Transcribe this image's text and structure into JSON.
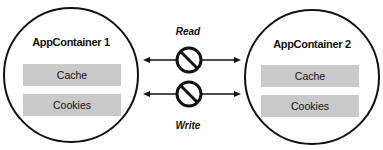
{
  "containers": [
    {
      "title": "AppContainer 1",
      "items": [
        "Cache",
        "Cookies"
      ]
    },
    {
      "title": "AppContainer 2",
      "items": [
        "Cache",
        "Cookies"
      ]
    }
  ],
  "connections": [
    {
      "label": "Read",
      "status": "blocked"
    },
    {
      "label": "Write",
      "status": "blocked"
    }
  ],
  "colors": {
    "box": "#c9c9c9",
    "stroke": "#111111"
  }
}
